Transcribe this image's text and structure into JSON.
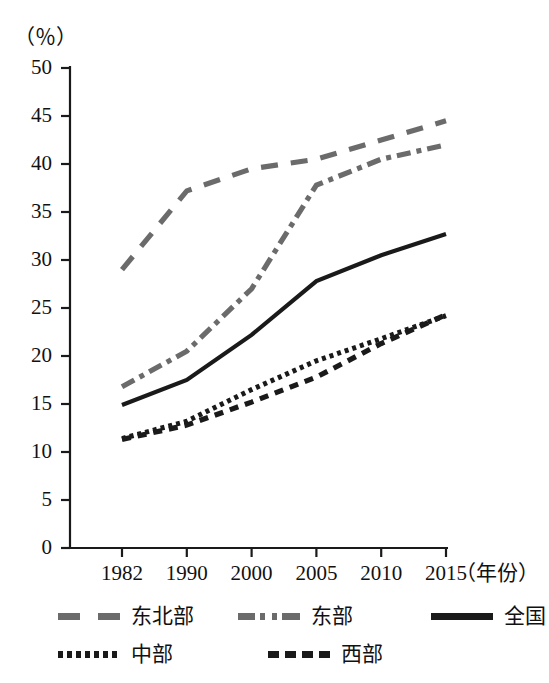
{
  "axes": {
    "unit_label": "（％）",
    "x_axis_title": "（年份）",
    "y_ticks": [
      "0",
      "5",
      "10",
      "15",
      "20",
      "25",
      "30",
      "35",
      "40",
      "45",
      "50"
    ],
    "x_ticks": [
      "1982",
      "1990",
      "2000",
      "2005",
      "2010",
      "2015"
    ]
  },
  "legend": {
    "items": [
      {
        "label": "东北部",
        "style": "dash-gray",
        "color": "#6b6b6b"
      },
      {
        "label": "东部",
        "style": "dashdot-gray",
        "color": "#6b6b6b"
      },
      {
        "label": "全国",
        "style": "solid",
        "color": "#1a1a1a"
      },
      {
        "label": "中部",
        "style": "dot",
        "color": "#1a1a1a"
      },
      {
        "label": "西部",
        "style": "dash-small",
        "color": "#1a1a1a"
      }
    ]
  },
  "chart_data": {
    "type": "line",
    "title": "",
    "xlabel": "（年份）",
    "ylabel": "（％）",
    "x": [
      "1982",
      "1990",
      "2000",
      "2005",
      "2010",
      "2015"
    ],
    "xlim": [
      0,
      5
    ],
    "ylim": [
      0,
      50
    ],
    "ytick_step": 5,
    "grid": false,
    "legend_position": "bottom",
    "series": [
      {
        "name": "东北部",
        "values": [
          29.0,
          37.2,
          39.5,
          40.5,
          42.5,
          44.5
        ],
        "color": "#6b6b6b",
        "dash": "long-dash"
      },
      {
        "name": "东部",
        "values": [
          16.8,
          20.5,
          27.0,
          37.8,
          40.5,
          42.0
        ],
        "color": "#6b6b6b",
        "dash": "dash-dot"
      },
      {
        "name": "全国",
        "values": [
          14.9,
          17.5,
          22.2,
          27.8,
          30.5,
          32.7
        ],
        "color": "#1a1a1a",
        "dash": "solid"
      },
      {
        "name": "中部",
        "values": [
          11.4,
          13.2,
          16.5,
          19.5,
          21.8,
          24.2
        ],
        "color": "#1a1a1a",
        "dash": "dotted"
      },
      {
        "name": "西部",
        "values": [
          11.3,
          12.8,
          15.2,
          17.8,
          21.3,
          24.3
        ],
        "color": "#1a1a1a",
        "dash": "short-dash"
      }
    ]
  }
}
